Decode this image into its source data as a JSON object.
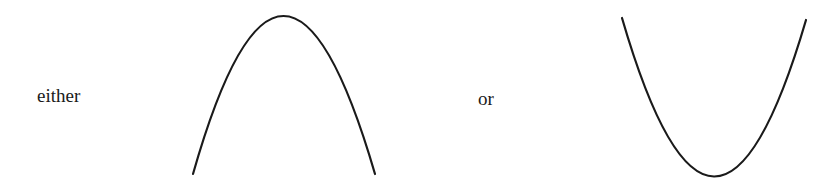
{
  "labels": {
    "either": "either",
    "or": "or"
  },
  "curves": [
    {
      "name": "concave-down-parabola",
      "start": [
        193,
        174
      ],
      "vertex": [
        283,
        16
      ],
      "end": [
        375,
        174
      ]
    },
    {
      "name": "concave-up-parabola",
      "start": [
        622,
        18
      ],
      "vertex": [
        715,
        176
      ],
      "end": [
        806,
        20
      ]
    }
  ],
  "colors": {
    "stroke": "#1a1a1a",
    "text": "#1a1a1a",
    "background": "#ffffff"
  }
}
